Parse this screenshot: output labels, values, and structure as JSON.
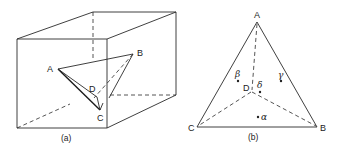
{
  "figure": {
    "panel_a": {
      "caption": "(a)",
      "description": "Cube with inscribed tetrahedron ABCD",
      "vertex_labels": {
        "A": "A",
        "B": "B",
        "C": "C",
        "D": "D"
      }
    },
    "panel_b": {
      "caption": "(b)",
      "description": "Triangle ABC with interior point D and phase regions",
      "vertex_labels": {
        "A": "A",
        "B": "B",
        "C": "C",
        "D": "D"
      },
      "phase_points": [
        {
          "symbol": "α",
          "name": "alpha"
        },
        {
          "symbol": "β",
          "name": "beta"
        },
        {
          "symbol": "γ",
          "name": "gamma"
        },
        {
          "symbol": "δ",
          "name": "delta"
        }
      ]
    },
    "line_color": "#2a2a2a",
    "background": "#ffffff"
  }
}
